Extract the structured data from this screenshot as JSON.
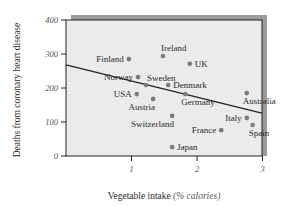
{
  "chart_data": {
    "type": "scatter",
    "title": "",
    "xlabel": "Vegetable intake",
    "xlabel_unit": "(% calories)",
    "ylabel": "Deaths from coronary heart disease",
    "xlim": [
      0,
      3
    ],
    "ylim": [
      0,
      400
    ],
    "x_ticks": [
      1,
      2,
      3
    ],
    "x_tick_labels": [
      "1",
      "2",
      "3"
    ],
    "y_ticks": [
      0,
      100,
      200,
      300,
      400
    ],
    "y_tick_labels": [
      "0",
      "100",
      "200",
      "300",
      "400"
    ],
    "grid": false,
    "legend": "none",
    "points": [
      {
        "label": "Finland",
        "x": 0.96,
        "y": 285,
        "label_side": "left"
      },
      {
        "label": "Norway",
        "x": 1.1,
        "y": 232,
        "label_side": "left"
      },
      {
        "label": "Ireland",
        "x": 1.48,
        "y": 294,
        "label_side": "above"
      },
      {
        "label": "UK",
        "x": 1.89,
        "y": 271,
        "label_side": "right"
      },
      {
        "label": "Sweden",
        "x": 1.22,
        "y": 209,
        "label_side": "above-right"
      },
      {
        "label": "Denmark",
        "x": 1.56,
        "y": 209,
        "label_side": "right"
      },
      {
        "label": "USA",
        "x": 1.08,
        "y": 182,
        "label_side": "left"
      },
      {
        "label": "Austria",
        "x": 1.33,
        "y": 168,
        "label_side": "below-left"
      },
      {
        "label": "Germany",
        "x": 1.82,
        "y": 182,
        "label_side": "below"
      },
      {
        "label": "Switzerland",
        "x": 1.62,
        "y": 118,
        "label_side": "below-left"
      },
      {
        "label": "Australia",
        "x": 2.76,
        "y": 185,
        "label_side": "below"
      },
      {
        "label": "Italy",
        "x": 2.76,
        "y": 112,
        "label_side": "left"
      },
      {
        "label": "Spain",
        "x": 2.85,
        "y": 91,
        "label_side": "below"
      },
      {
        "label": "France",
        "x": 2.37,
        "y": 76,
        "label_side": "left"
      },
      {
        "label": "Japan",
        "x": 1.62,
        "y": 26,
        "label_side": "right"
      }
    ],
    "trend_line": {
      "x": [
        0,
        2.99
      ],
      "y": [
        268,
        126
      ]
    },
    "colors": {
      "plot_background": "#ebebeb",
      "shadow": "#9a9a9a",
      "axis": "#222222",
      "point": "#7a7a7a",
      "trend_line": "#222222",
      "tick_label": "#555555",
      "point_label": "#2a2a2a"
    }
  }
}
